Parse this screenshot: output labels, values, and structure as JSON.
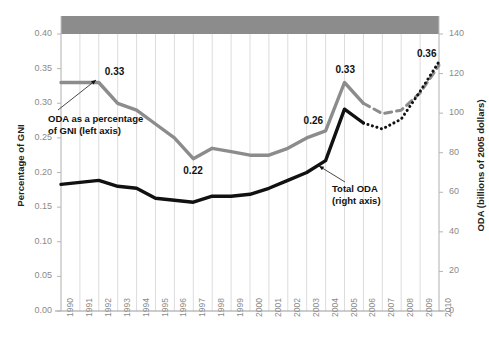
{
  "figure": {
    "top_band_color": "#8c8c8c",
    "cutoff_header_text": "",
    "background": "#ffffff"
  },
  "axes": {
    "left": {
      "title": "Percentage of GNI",
      "ticks": [
        "0.00",
        "0.05",
        "0.10",
        "0.15",
        "0.20",
        "0.25",
        "0.30",
        "0.35",
        "0.40"
      ],
      "min": 0.0,
      "max": 0.4
    },
    "right": {
      "title": "ODA (billions of 2005 dollars)",
      "ticks": [
        "0",
        "20",
        "40",
        "60",
        "80",
        "100",
        "120",
        "140"
      ],
      "min": 0,
      "max": 140
    }
  },
  "annotations": {
    "gray_series_note": [
      "ODA as a percentage",
      "of GNI (left axis)"
    ],
    "black_series_note": [
      "Total ODA",
      "(right axis)"
    ]
  },
  "data_labels": [
    {
      "text": "0.33",
      "year": 1992,
      "series": "oda_pct_gni"
    },
    {
      "text": "0.22",
      "year": 1997,
      "series": "oda_pct_gni"
    },
    {
      "text": "0.26",
      "year": 2004,
      "series": "oda_pct_gni"
    },
    {
      "text": "0.33",
      "year": 2005,
      "series": "oda_pct_gni"
    },
    {
      "text": "0.36",
      "year": 2010,
      "series": "oda_pct_gni_projected"
    }
  ],
  "colors": {
    "gray_series": "#8c8c8c",
    "black_series": "#111111",
    "gridline": "#dcdcdc",
    "tick_text": "#8a8a8a"
  },
  "chart_data": {
    "type": "line",
    "title": "",
    "subtitle": "",
    "xlabel": "",
    "ylabel": "Percentage of GNI",
    "y2label": "ODA (billions of 2005 dollars)",
    "ylim": [
      0.0,
      0.4
    ],
    "y2lim": [
      0,
      140
    ],
    "grid": true,
    "legend": "annotations",
    "x": [
      1990,
      1991,
      1992,
      1993,
      1994,
      1995,
      1996,
      1997,
      1998,
      1999,
      2000,
      2001,
      2002,
      2003,
      2004,
      2005,
      2006,
      2007,
      2008,
      2009,
      2010
    ],
    "categories": [
      "1990",
      "1991",
      "1992",
      "1993",
      "1994",
      "1995",
      "1996",
      "1997",
      "1998",
      "1999",
      "2000",
      "2001",
      "2002",
      "2003",
      "2004",
      "2005",
      "2006",
      "2007",
      "2008",
      "2009",
      "2010"
    ],
    "series": [
      {
        "name": "ODA as a percentage of GNI (left axis)",
        "axis": "left",
        "color": "#8c8c8c",
        "style": "solid",
        "values": [
          0.33,
          0.33,
          0.33,
          0.3,
          0.29,
          0.27,
          0.25,
          0.22,
          0.235,
          0.23,
          0.225,
          0.225,
          0.235,
          0.25,
          0.26,
          0.33,
          0.3,
          null,
          null,
          null,
          null
        ]
      },
      {
        "name": "ODA as a percentage of GNI (projected)",
        "axis": "left",
        "color": "#8c8c8c",
        "style": "dashed",
        "values": [
          null,
          null,
          null,
          null,
          null,
          null,
          null,
          null,
          null,
          null,
          null,
          null,
          null,
          null,
          null,
          null,
          0.3,
          0.285,
          0.29,
          0.315,
          0.355
        ]
      },
      {
        "name": "Total ODA (right axis)",
        "axis": "right",
        "color": "#111111",
        "style": "solid",
        "values": [
          64,
          65,
          66,
          63,
          62,
          57,
          56,
          55,
          58,
          58,
          59,
          62,
          66,
          70,
          76,
          102,
          95,
          null,
          null,
          null,
          null
        ]
      },
      {
        "name": "Total ODA (projected)",
        "axis": "right",
        "color": "#111111",
        "style": "dotted",
        "values": [
          null,
          null,
          null,
          null,
          null,
          null,
          null,
          null,
          null,
          null,
          null,
          null,
          null,
          null,
          null,
          null,
          95,
          92,
          97,
          111,
          126
        ]
      }
    ]
  }
}
